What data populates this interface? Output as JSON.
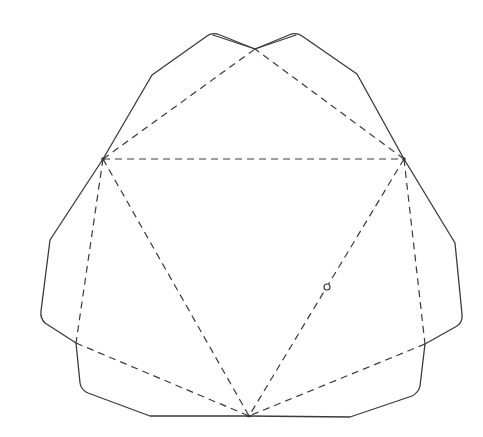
{
  "diagram": {
    "type": "fold-net",
    "colors": {
      "background": "#ffffff",
      "line": "#3a3a3a"
    },
    "line_styles": {
      "cut": "solid",
      "fold": "dashed"
    },
    "vertices": {
      "A_left": [
        103,
        159
      ],
      "B_right": [
        404,
        159
      ],
      "C_bottom": [
        249,
        416
      ],
      "D_top_cross": [
        255,
        49
      ],
      "E_lower_left": [
        76,
        343
      ],
      "F_lower_right": [
        425,
        344
      ]
    },
    "fold_lines": [
      {
        "from": "A_left",
        "to": "B_right"
      },
      {
        "from": "A_left",
        "to": "C_bottom"
      },
      {
        "from": "B_right",
        "to": "C_bottom"
      },
      {
        "from": "A_left",
        "to": "D_top_cross"
      },
      {
        "from": "B_right",
        "to": "D_top_cross"
      },
      {
        "from": "A_left",
        "to": "E_lower_left"
      },
      {
        "from": "B_right",
        "to": "F_lower_right"
      },
      {
        "from": "E_lower_left",
        "to": "C_bottom"
      },
      {
        "from": "F_lower_right",
        "to": "C_bottom"
      }
    ],
    "markers": [
      {
        "shape": "small-circle",
        "position": [
          327,
          287
        ]
      }
    ]
  }
}
